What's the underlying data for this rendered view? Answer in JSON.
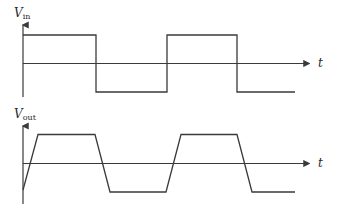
{
  "diagram": {
    "type": "waveform-comparison",
    "stroke_color": "#3a3a3a",
    "background": "#ffffff",
    "panels": [
      {
        "id": "input",
        "y_label": "V",
        "y_label_sub": "in",
        "x_label": "t",
        "waveform": "square",
        "description": "Ideal square wave input with instantaneous transitions",
        "levels": {
          "high": 1,
          "low": -1
        },
        "transitions_px_x": [
          96,
          167,
          237
        ],
        "segments": [
          {
            "from_x": 23,
            "to_x": 96,
            "level": "high"
          },
          {
            "from_x": 96,
            "to_x": 167,
            "level": "low"
          },
          {
            "from_x": 167,
            "to_x": 237,
            "level": "high"
          },
          {
            "from_x": 237,
            "to_x": 295,
            "level": "low"
          }
        ]
      },
      {
        "id": "output",
        "y_label": "V",
        "y_label_sub": "out",
        "x_label": "t",
        "waveform": "trapezoidal",
        "description": "Output with finite slew rate (sloped rise/fall edges)",
        "levels": {
          "high": 1,
          "low": -1
        },
        "segments": [
          {
            "shape": "rise",
            "from_x": 23,
            "to_x": 38
          },
          {
            "shape": "flat-high",
            "from_x": 38,
            "to_x": 95
          },
          {
            "shape": "fall",
            "from_x": 95,
            "to_x": 110
          },
          {
            "shape": "flat-low",
            "from_x": 110,
            "to_x": 166
          },
          {
            "shape": "rise",
            "from_x": 166,
            "to_x": 181
          },
          {
            "shape": "flat-high",
            "from_x": 181,
            "to_x": 237
          },
          {
            "shape": "fall",
            "from_x": 237,
            "to_x": 252
          },
          {
            "shape": "flat-low",
            "from_x": 252,
            "to_x": 295
          }
        ]
      }
    ]
  }
}
